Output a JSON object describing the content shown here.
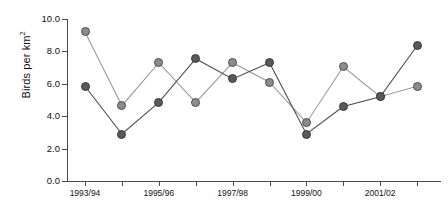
{
  "chart_data": {
    "type": "line",
    "title": "",
    "xlabel": "",
    "ylabel": "Birds per km",
    "ylabel_superscript": "2",
    "categories": [
      "1993/94",
      "1994/95",
      "1995/96",
      "1996/97",
      "1997/98",
      "1998/99",
      "1999/00",
      "2000/01",
      "2001/02",
      "2002/03"
    ],
    "tick_labels_shown": [
      "1993/94",
      "1995/96",
      "1997/98",
      "1999/00",
      "2001/02"
    ],
    "ylim": [
      0.0,
      10.0
    ],
    "yticks": [
      0.0,
      2.0,
      4.0,
      6.0,
      8.0,
      10.0
    ],
    "ytick_labels": [
      "0.0",
      "2.0",
      "4.0",
      "6.0",
      "8.0",
      "10.0"
    ],
    "grid": false,
    "legend": "none",
    "series": [
      {
        "name": "series-light",
        "color": "#8c8c8c",
        "marker": "filled-circle-light",
        "values": [
          9.2,
          4.65,
          7.3,
          4.85,
          7.3,
          6.1,
          3.6,
          7.05,
          5.2,
          5.85
        ]
      },
      {
        "name": "series-dark",
        "color": "#595959",
        "marker": "filled-circle-dark",
        "values": [
          5.85,
          2.9,
          4.85,
          7.55,
          6.3,
          7.3,
          2.9,
          4.6,
          5.2,
          8.35
        ]
      }
    ]
  },
  "axes": {
    "y_axis_color": "#4a4a4a",
    "x_axis_color": "#4a4a4a"
  }
}
